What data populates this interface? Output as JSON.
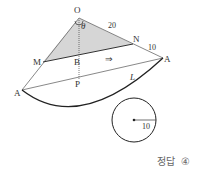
{
  "diagram": {
    "type": "geometry-cone-net",
    "points": {
      "O": "O",
      "N": "N",
      "M": "M",
      "B": "B",
      "P": "P",
      "A_left": "A",
      "A_right": "A"
    },
    "angle_label": "θ",
    "segment_labels": {
      "ON": "20",
      "NA": "10",
      "line_L": "L",
      "radius": "10"
    },
    "arrow": "⇒",
    "colors": {
      "shaded_region": "#d9d9d9",
      "lines": "#333333",
      "arc": "#222222"
    }
  },
  "answer": {
    "label": "정답",
    "value": "④"
  }
}
